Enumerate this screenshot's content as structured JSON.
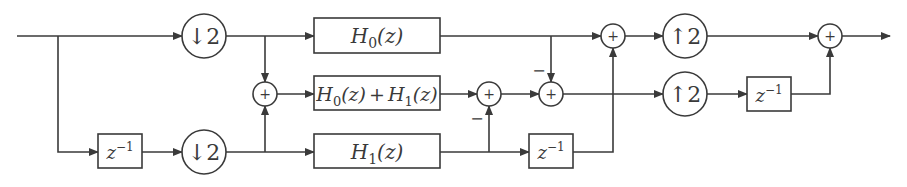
{
  "diagram": {
    "type": "polyphase filter bank block diagram",
    "blocks": {
      "down2_top": {
        "symbol": "↓2",
        "label": "downsample by 2"
      },
      "down2_bottom": {
        "symbol": "↓2",
        "label": "downsample by 2"
      },
      "delay_in": {
        "base": "z",
        "exp": "−1"
      },
      "h0": {
        "base": "H",
        "sub": "0",
        "arg": "(z)"
      },
      "h0h1": {
        "a_base": "H",
        "a_sub": "0",
        "a_arg": "(z)",
        "op": "+",
        "b_base": "H",
        "b_sub": "1",
        "b_arg": "(z)"
      },
      "h1": {
        "base": "H",
        "sub": "1",
        "arg": "(z)"
      },
      "delay_mid": {
        "base": "z",
        "exp": "−1"
      },
      "up2_top": {
        "symbol": "↑2",
        "label": "upsample by 2"
      },
      "up2_bottom": {
        "symbol": "↑2",
        "label": "upsample by 2"
      },
      "delay_out": {
        "base": "z",
        "exp": "−1"
      }
    },
    "adders": {
      "sum_in": "+",
      "sum_mid1": "+",
      "sum_mid2": "+",
      "sum_top": "+",
      "sum_out": "+"
    },
    "signs": {
      "minus_mid1": "−",
      "minus_mid2": "−"
    }
  }
}
